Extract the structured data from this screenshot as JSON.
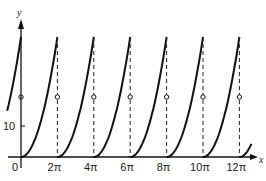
{
  "chart_data": {
    "type": "line",
    "title": "",
    "xlabel": "x",
    "ylabel": "y",
    "x_ticks": [
      "0",
      "2π",
      "4π",
      "6π",
      "8π",
      "10π",
      "12π"
    ],
    "y_ticks": [
      "10"
    ],
    "period": "2π",
    "period_count": 6,
    "peak_value_approx": 39.48,
    "jump_midpoint_value_approx": 19.74,
    "discontinuities": [
      "2π",
      "4π",
      "6π",
      "8π",
      "10π",
      "12π"
    ],
    "grid": false,
    "legend": false
  },
  "axes": {
    "x_label": "x",
    "y_label": "y",
    "tick_labels": [
      "0",
      "2π",
      "4π",
      "6π",
      "8π",
      "10π",
      "12π"
    ],
    "y_tick_label": "10"
  }
}
